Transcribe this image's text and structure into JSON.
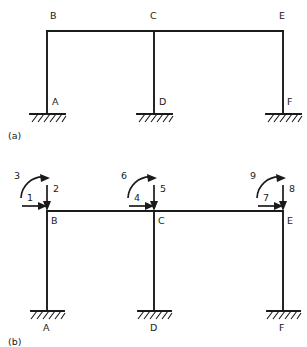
{
  "figure": {
    "type": "structural-frame-diagram",
    "line_color": "#1a1a1a",
    "background_color": "#ffffff"
  },
  "panel_a": {
    "caption": "(a)",
    "joint_labels": [
      {
        "name": "B",
        "text": "B",
        "x": 50,
        "y": 19
      },
      {
        "name": "C",
        "text": "C",
        "x": 150,
        "y": 19
      },
      {
        "name": "E",
        "text": "E",
        "x": 279,
        "y": 19
      }
    ],
    "support_labels": [
      {
        "name": "A",
        "text": "A",
        "x": 52,
        "y": 105
      },
      {
        "name": "D",
        "text": "D",
        "x": 159,
        "y": 105
      },
      {
        "name": "F",
        "text": "F",
        "x": 287,
        "y": 105
      }
    ],
    "geometry": {
      "beam_y": 31,
      "ground_y": 114,
      "columns_x": [
        47,
        154,
        283
      ]
    }
  },
  "panel_b": {
    "caption": "(b)",
    "joint_labels": [
      {
        "name": "B",
        "text": "B",
        "x": 51,
        "y": 224
      },
      {
        "name": "C",
        "text": "C",
        "x": 158,
        "y": 224
      },
      {
        "name": "E",
        "text": "E",
        "x": 287,
        "y": 224
      }
    ],
    "support_labels": [
      {
        "name": "A",
        "text": "A",
        "x": 43,
        "y": 331
      },
      {
        "name": "D",
        "text": "D",
        "x": 150,
        "y": 331
      },
      {
        "name": "F",
        "text": "F",
        "x": 279,
        "y": 331
      }
    ],
    "geometry": {
      "beam_y": 211,
      "ground_y": 311,
      "columns_x": [
        47,
        154,
        283
      ]
    },
    "dof": [
      {
        "id": "1",
        "joint": "B",
        "kind": "horizontal-force",
        "label": "1",
        "label_x": 27,
        "label_y": 201
      },
      {
        "id": "2",
        "joint": "B",
        "kind": "vertical-force",
        "label": "2",
        "label_x": 53,
        "label_y": 192
      },
      {
        "id": "3",
        "joint": "B",
        "kind": "moment",
        "label": "3",
        "label_x": 14,
        "label_y": 179
      },
      {
        "id": "4",
        "joint": "C",
        "kind": "horizontal-force",
        "label": "4",
        "label_x": 134,
        "label_y": 201
      },
      {
        "id": "5",
        "joint": "C",
        "kind": "vertical-force",
        "label": "5",
        "label_x": 160,
        "label_y": 192
      },
      {
        "id": "6",
        "joint": "C",
        "kind": "moment",
        "label": "6",
        "label_x": 121,
        "label_y": 179
      },
      {
        "id": "7",
        "joint": "E",
        "kind": "horizontal-force",
        "label": "7",
        "label_x": 263,
        "label_y": 201
      },
      {
        "id": "8",
        "joint": "E",
        "kind": "vertical-force",
        "label": "8",
        "label_x": 289,
        "label_y": 192
      },
      {
        "id": "9",
        "joint": "E",
        "kind": "moment",
        "label": "9",
        "label_x": 250,
        "label_y": 179
      }
    ]
  }
}
